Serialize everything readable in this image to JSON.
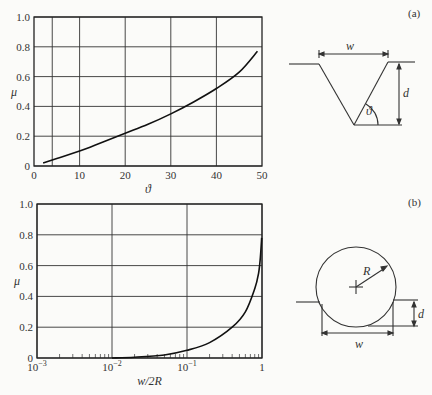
{
  "header": {
    "title": ""
  },
  "chart_data": [
    {
      "id": "a",
      "type": "line",
      "panel_label": "(a)",
      "title": "",
      "xlabel": "ϑ",
      "ylabel": "μ",
      "xlim": [
        0,
        50
      ],
      "ylim": [
        0,
        1.0
      ],
      "xscale": "linear",
      "grid": true,
      "x_grid_lines": [
        4,
        10,
        20,
        30,
        40
      ],
      "xticks": [
        0,
        10,
        20,
        30,
        40,
        50
      ],
      "xtick_labels": [
        "0",
        "10",
        "20",
        "30",
        "40",
        "50"
      ],
      "yticks": [
        0,
        0.2,
        0.4,
        0.6,
        0.8,
        1.0
      ],
      "ytick_labels": [
        "0",
        "0.2",
        "0.4",
        "0.6",
        "0.8",
        "1.0"
      ],
      "series": [
        {
          "name": "μ vs ϑ (V-groove)",
          "x": [
            2,
            5,
            10,
            15,
            20,
            25,
            30,
            35,
            40,
            45,
            49
          ],
          "y": [
            0.02,
            0.05,
            0.1,
            0.16,
            0.22,
            0.28,
            0.35,
            0.43,
            0.52,
            0.63,
            0.77
          ]
        }
      ]
    },
    {
      "id": "b",
      "type": "line",
      "panel_label": "(b)",
      "title": "",
      "xlabel": "w/2R",
      "ylabel": "μ",
      "xlim": [
        0.001,
        1
      ],
      "ylim": [
        0,
        1.0
      ],
      "xscale": "log",
      "grid": true,
      "xticks": [
        0.001,
        0.01,
        0.1,
        1
      ],
      "xtick_labels": [
        "10⁻³",
        "10⁻²",
        "10⁻¹",
        "1"
      ],
      "yticks": [
        0,
        0.2,
        0.4,
        0.6,
        0.8,
        1.0
      ],
      "ytick_labels": [
        "0",
        "0.2",
        "0.4",
        "0.6",
        "0.8",
        "1.0"
      ],
      "series": [
        {
          "name": "μ vs w/2R (circular groove)",
          "x": [
            0.01,
            0.02,
            0.05,
            0.1,
            0.2,
            0.4,
            0.6,
            0.8,
            0.9,
            0.95,
            0.99
          ],
          "y": [
            0.0,
            0.005,
            0.02,
            0.05,
            0.1,
            0.2,
            0.3,
            0.45,
            0.55,
            0.65,
            0.78
          ]
        }
      ]
    }
  ],
  "diagrams": {
    "a": {
      "label": "(a)",
      "width_label": "w",
      "depth_label": "d",
      "angle_label": "ϑ"
    },
    "b": {
      "label": "(b)",
      "radius_label": "R",
      "width_label": "w",
      "depth_label": "d"
    }
  }
}
